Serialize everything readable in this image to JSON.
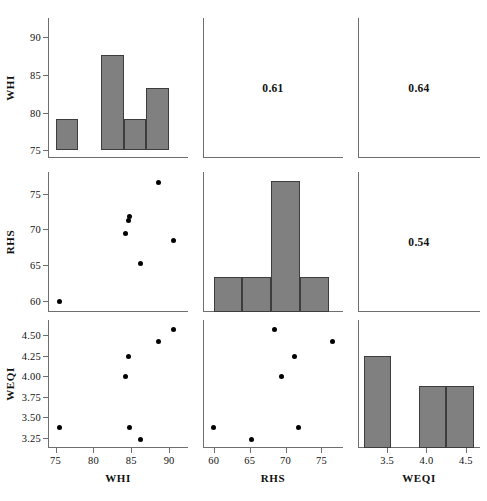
{
  "figure": {
    "type": "scatter-plot-matrix",
    "variables": [
      "WHI",
      "RHS",
      "WEQI"
    ],
    "n_observations": 7,
    "diagonal": "histogram",
    "upper_triangle": "correlation-coefficient",
    "lower_triangle": "scatter",
    "marker_color": "#000000",
    "bar_fill_color": "#808080",
    "bar_edge_color": "#3d3d3d",
    "axis_color": "#6e6e6e",
    "background": "#ffffff"
  },
  "axes": {
    "WHI": {
      "label": "WHI",
      "min": 74.0,
      "max": 92.5,
      "ticks": [
        75,
        80,
        85,
        90
      ],
      "ticklabels": [
        "75",
        "80",
        "85",
        "90"
      ]
    },
    "RHS": {
      "label": "RHS",
      "min": 58.5,
      "max": 78.0,
      "ticks": [
        60,
        65,
        70,
        75
      ],
      "ticklabels": [
        "60",
        "65",
        "70",
        "75"
      ]
    },
    "WEQI": {
      "label": "WEQI",
      "min": 3.13,
      "max": 4.68,
      "ticks": [
        3.25,
        3.5,
        3.75,
        4.0,
        4.25,
        4.5
      ],
      "ticklabels": [
        "3.25",
        "3.50",
        "3.75",
        "4.00",
        "4.25",
        "4.50"
      ],
      "xticks": [
        3.5,
        4.0,
        4.5
      ],
      "xticklabels": [
        "3.5",
        "4.0",
        "4.5"
      ]
    }
  },
  "correlations": [
    {
      "name": "WHI-RHS",
      "row": "WHI",
      "col": "RHS",
      "value": "0.61"
    },
    {
      "name": "WHI-WEQI",
      "row": "WHI",
      "col": "WEQI",
      "value": "0.64"
    },
    {
      "name": "RHS-WEQI",
      "row": "RHS",
      "col": "WEQI",
      "value": "0.54"
    }
  ],
  "chart_data": {
    "type": "scatter",
    "title": "",
    "xlabel": "",
    "ylabel": "",
    "variables": [
      "WHI",
      "RHS",
      "WEQI"
    ],
    "observations": [
      {
        "WHI": 75.5,
        "RHS": 60.0,
        "WEQI": 3.38
      },
      {
        "WHI": 84.3,
        "RHS": 69.5,
        "WEQI": 4.0
      },
      {
        "WHI": 84.6,
        "RHS": 71.3,
        "WEQI": 4.24
      },
      {
        "WHI": 84.8,
        "RHS": 71.8,
        "WEQI": 3.38
      },
      {
        "WHI": 86.2,
        "RHS": 65.2,
        "WEQI": 3.23
      },
      {
        "WHI": 88.6,
        "RHS": 76.6,
        "WEQI": 4.42
      },
      {
        "WHI": 90.6,
        "RHS": 68.4,
        "WEQI": 4.57
      }
    ],
    "histograms": {
      "WHI": {
        "xlabel": "WHI",
        "ylabel": "WHI",
        "bin_edges": [
          75.0,
          78.0,
          81.0,
          84.0,
          87.0,
          90.0
        ],
        "bin_tops": [
          79.2,
          75.0,
          87.6,
          79.2,
          83.3
        ],
        "baseline": 75.0
      },
      "RHS": {
        "xlabel": "RHS",
        "ylabel": "RHS",
        "bin_edges": [
          60.0,
          64.0,
          68.0,
          72.0,
          76.0
        ],
        "bin_tops": [
          63.4,
          63.4,
          76.8,
          63.4
        ],
        "baseline": 58.5
      },
      "WEQI": {
        "xlabel": "WEQI",
        "ylabel": "WEQI",
        "bin_edges": [
          3.2,
          3.55,
          3.9,
          4.25,
          4.6
        ],
        "bin_tops": [
          4.24,
          3.13,
          3.88,
          3.88
        ],
        "baseline": 3.13
      }
    }
  }
}
